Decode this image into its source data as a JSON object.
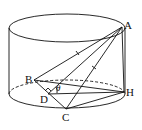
{
  "diagram": {
    "type": "cylinder-geometry",
    "points": {
      "A": {
        "label": "A",
        "x": 122,
        "y": 27
      },
      "B": {
        "label": "B",
        "x": 34,
        "y": 80
      },
      "C": {
        "label": "C",
        "x": 66,
        "y": 109
      },
      "D": {
        "label": "D",
        "x": 48,
        "y": 94
      },
      "H": {
        "label": "H",
        "x": 124,
        "y": 92
      }
    },
    "angle_label": "θ",
    "segments": [
      "AB",
      "AC",
      "AD",
      "AH",
      "BH",
      "BC",
      "CH",
      "DH"
    ],
    "marks": [
      "AB equal-tick",
      "AC equal-tick"
    ],
    "right_angle_at": "D"
  }
}
